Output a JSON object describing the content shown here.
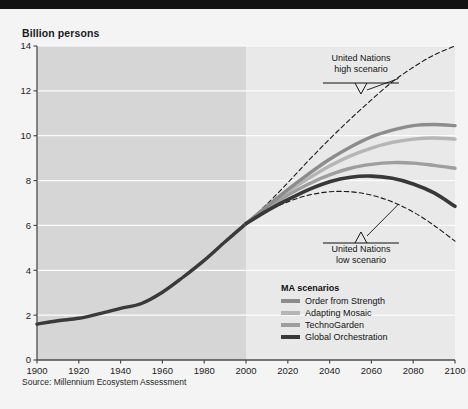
{
  "chart_data": {
    "type": "line",
    "title": "Billion persons",
    "xlabel": "",
    "ylabel": "Billion persons",
    "xlim": [
      1900,
      2100
    ],
    "ylim": [
      0,
      14
    ],
    "xticks": [
      1900,
      1920,
      1940,
      1960,
      1980,
      2000,
      2020,
      2040,
      2060,
      2080,
      2100
    ],
    "yticks": [
      0,
      2,
      4,
      6,
      8,
      10,
      12,
      14
    ],
    "grid": "horizontal",
    "legend_position": "inside-bottom-right",
    "historical_projection_split_year": 2000,
    "source": "Source: Millennium Ecosystem Assessment",
    "x": [
      1900,
      1910,
      1920,
      1930,
      1940,
      1950,
      1960,
      1970,
      1980,
      1990,
      2000,
      2010,
      2020,
      2030,
      2040,
      2050,
      2060,
      2070,
      2080,
      2090,
      2100
    ],
    "series": [
      {
        "name": "Historical",
        "color": "#3a3a3a",
        "style": "solid",
        "width": 3.4,
        "in_legend": false,
        "values": [
          1.6,
          1.75,
          1.86,
          2.07,
          2.3,
          2.52,
          3.02,
          3.7,
          4.44,
          5.27,
          6.08,
          null,
          null,
          null,
          null,
          null,
          null,
          null,
          null,
          null,
          null
        ]
      },
      {
        "name": "United Nations high scenario",
        "color": "#1a1a1a",
        "style": "dashed",
        "width": 1.1,
        "in_legend": false,
        "values": [
          null,
          null,
          null,
          null,
          null,
          null,
          null,
          null,
          null,
          null,
          6.08,
          6.95,
          7.9,
          8.9,
          9.85,
          10.75,
          11.6,
          12.4,
          13.05,
          13.6,
          14.0
        ]
      },
      {
        "name": "United Nations low scenario",
        "color": "#1a1a1a",
        "style": "dashed",
        "width": 1.1,
        "in_legend": false,
        "values": [
          null,
          null,
          null,
          null,
          null,
          null,
          null,
          null,
          null,
          null,
          6.08,
          6.62,
          7.05,
          7.35,
          7.5,
          7.5,
          7.35,
          7.05,
          6.6,
          6.0,
          5.3
        ]
      },
      {
        "name": "Order from Strength",
        "color": "#8c8c8c",
        "style": "solid",
        "width": 3.4,
        "in_legend": true,
        "values": [
          null,
          null,
          null,
          null,
          null,
          null,
          null,
          null,
          null,
          null,
          6.08,
          6.85,
          7.6,
          8.3,
          8.95,
          9.5,
          9.95,
          10.25,
          10.45,
          10.5,
          10.45
        ]
      },
      {
        "name": "Adapting Mosaic",
        "color": "#b5b5b5",
        "style": "solid",
        "width": 3.4,
        "in_legend": true,
        "values": [
          null,
          null,
          null,
          null,
          null,
          null,
          null,
          null,
          null,
          null,
          6.08,
          6.8,
          7.5,
          8.1,
          8.65,
          9.1,
          9.45,
          9.7,
          9.85,
          9.9,
          9.85
        ]
      },
      {
        "name": "TechnoGarden",
        "color": "#9e9e9e",
        "style": "solid",
        "width": 3.4,
        "in_legend": true,
        "values": [
          null,
          null,
          null,
          null,
          null,
          null,
          null,
          null,
          null,
          null,
          6.08,
          6.75,
          7.35,
          7.85,
          8.25,
          8.55,
          8.72,
          8.8,
          8.78,
          8.68,
          8.55
        ]
      },
      {
        "name": "Global Orchestration",
        "color": "#383838",
        "style": "solid",
        "width": 3.6,
        "in_legend": true,
        "values": [
          null,
          null,
          null,
          null,
          null,
          null,
          null,
          null,
          null,
          null,
          6.08,
          6.65,
          7.15,
          7.6,
          7.95,
          8.15,
          8.2,
          8.1,
          7.85,
          7.45,
          6.85
        ]
      }
    ],
    "annotations": [
      {
        "id": "un-high",
        "line1": "United Nations",
        "line2": "high scenario",
        "target_year": 2073,
        "target_value": 12.55
      },
      {
        "id": "un-low",
        "line1": "United Nations",
        "line2": "low scenario",
        "target_year": 2073,
        "target_value": 6.95
      }
    ]
  },
  "legend": {
    "title": "MA scenarios",
    "items": [
      {
        "label": "Order from Strength",
        "color": "#8c8c8c"
      },
      {
        "label": "Adapting Mosaic",
        "color": "#b5b5b5"
      },
      {
        "label": "TechnoGarden",
        "color": "#9e9e9e"
      },
      {
        "label": "Global Orchestration",
        "color": "#383838"
      }
    ]
  },
  "colors": {
    "page_background": "#f4f4f4",
    "top_bar": "#121212",
    "plot_historical_band": "#d6d6d6",
    "plot_projection_band": "#e9e9e9",
    "gridline": "#fcfcfc",
    "axis": "#4d4d4d"
  }
}
